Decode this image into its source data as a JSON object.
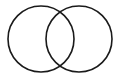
{
  "diagram": {
    "type": "venn",
    "background": "#ffffff",
    "stroke_color": "#1a1a1a",
    "stroke_width": 1.6,
    "circles": [
      {
        "name": "left-set",
        "cx": 41,
        "cy": 39,
        "r": 33
      },
      {
        "name": "right-set",
        "cx": 79,
        "cy": 39,
        "r": 33
      }
    ]
  }
}
